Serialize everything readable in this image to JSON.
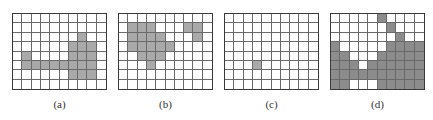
{
  "figure": {
    "cols": 10,
    "rows": 8,
    "panels": [
      {
        "label": "(a)",
        "x": 12,
        "fill": "#a9a9a9",
        "filled": [
          [
            2,
            7
          ],
          [
            3,
            6
          ],
          [
            3,
            7
          ],
          [
            3,
            8
          ],
          [
            4,
            1
          ],
          [
            4,
            6
          ],
          [
            4,
            7
          ],
          [
            4,
            8
          ],
          [
            5,
            1
          ],
          [
            5,
            2
          ],
          [
            5,
            3
          ],
          [
            5,
            4
          ],
          [
            5,
            5
          ],
          [
            5,
            6
          ],
          [
            5,
            7
          ],
          [
            5,
            8
          ],
          [
            6,
            6
          ],
          [
            6,
            7
          ],
          [
            6,
            8
          ]
        ]
      },
      {
        "label": "(b)",
        "x": 118,
        "fill": "#a9a9a9",
        "filled": [
          [
            1,
            1
          ],
          [
            1,
            2
          ],
          [
            1,
            3
          ],
          [
            1,
            7
          ],
          [
            1,
            8
          ],
          [
            2,
            1
          ],
          [
            2,
            2
          ],
          [
            2,
            3
          ],
          [
            2,
            4
          ],
          [
            2,
            8
          ],
          [
            3,
            1
          ],
          [
            3,
            2
          ],
          [
            3,
            3
          ],
          [
            3,
            4
          ],
          [
            3,
            5
          ],
          [
            4,
            2
          ],
          [
            4,
            3
          ],
          [
            4,
            4
          ],
          [
            5,
            3
          ]
        ]
      },
      {
        "label": "(c)",
        "x": 224,
        "fill": "#a9a9a9",
        "filled": [
          [
            5,
            3
          ]
        ]
      },
      {
        "label": "(d)",
        "x": 330,
        "fill": "#8c8c8c",
        "filled": [
          [
            0,
            5
          ],
          [
            1,
            6
          ],
          [
            2,
            7
          ],
          [
            3,
            0
          ],
          [
            3,
            6
          ],
          [
            3,
            7
          ],
          [
            3,
            8
          ],
          [
            3,
            9
          ],
          [
            4,
            0
          ],
          [
            4,
            1
          ],
          [
            4,
            5
          ],
          [
            4,
            6
          ],
          [
            4,
            7
          ],
          [
            4,
            8
          ],
          [
            4,
            9
          ],
          [
            5,
            0
          ],
          [
            5,
            1
          ],
          [
            5,
            2
          ],
          [
            5,
            4
          ],
          [
            5,
            5
          ],
          [
            5,
            6
          ],
          [
            5,
            7
          ],
          [
            5,
            8
          ],
          [
            5,
            9
          ],
          [
            6,
            0
          ],
          [
            6,
            1
          ],
          [
            6,
            2
          ],
          [
            6,
            3
          ],
          [
            6,
            4
          ],
          [
            6,
            5
          ],
          [
            6,
            6
          ],
          [
            6,
            7
          ],
          [
            6,
            8
          ],
          [
            6,
            9
          ],
          [
            7,
            0
          ],
          [
            7,
            1
          ],
          [
            7,
            5
          ],
          [
            7,
            6
          ],
          [
            7,
            7
          ],
          [
            7,
            8
          ],
          [
            7,
            9
          ]
        ]
      }
    ]
  }
}
